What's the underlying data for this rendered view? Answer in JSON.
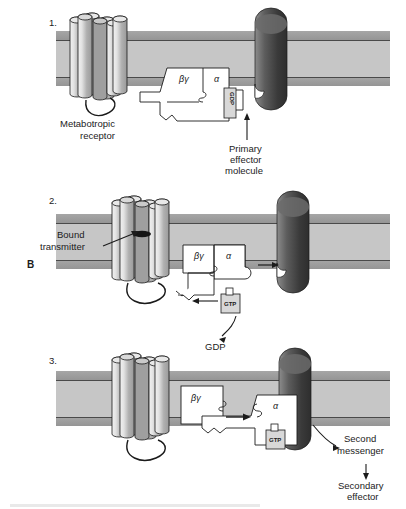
{
  "figure": {
    "panel_letter": "B",
    "caption_partial": "",
    "colors": {
      "membrane_band": "#9d9d9d",
      "membrane_core": "#c6c6c6",
      "membrane_line": "#4a4a4a",
      "effector_dark": "#4a4a4a",
      "effector_mid": "#6e6e6e",
      "cylinder_light": "#dcdcdc",
      "cylinder_mid": "#b4b4b4",
      "protein_fill": "#ffffff",
      "nucleotide_fill": "#d8d8d8",
      "stroke": "#1b1b1b"
    }
  },
  "steps": [
    {
      "number": "1.",
      "labels": {
        "receptor": "Metabotropic\nreceptor",
        "receptor_line1": "Metabotropic",
        "receptor_line2": "receptor",
        "effector_line1": "Primary",
        "effector_line2": "effector",
        "effector_line3": "molecule"
      },
      "subunits": {
        "beta_gamma": "βγ",
        "alpha": "α"
      },
      "nucleotide": "GDP"
    },
    {
      "number": "2.",
      "labels": {
        "transmitter_line1": "Bound",
        "transmitter_line2": "transmitter",
        "released": "GDP"
      },
      "subunits": {
        "beta_gamma": "βγ",
        "alpha": "α"
      },
      "nucleotide": "GTP"
    },
    {
      "number": "3.",
      "labels": {
        "second_line1": "Second",
        "second_line2": "messenger",
        "secondary_line1": "Secondary",
        "secondary_line2": "effector"
      },
      "subunits": {
        "beta_gamma": "βγ",
        "alpha": "α"
      },
      "nucleotide": "GTP"
    }
  ]
}
